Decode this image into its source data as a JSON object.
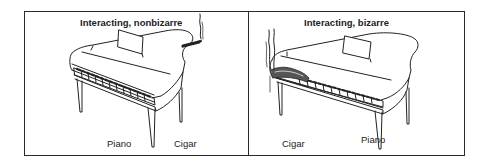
{
  "figure": {
    "panels": [
      {
        "id": "left",
        "title": "Interacting, nonbizarre",
        "labels": {
          "piano": "Piano",
          "cigar": "Cigar"
        },
        "description": "Grand piano with a cigar resting on the lid edge, smoke rising"
      },
      {
        "id": "right",
        "title": "Interacting, bizarre",
        "labels": {
          "cigar": "Cigar",
          "piano": "Piano"
        },
        "description": "Grand piano with a large cigar crushing the keyboard, smoke rising"
      }
    ],
    "colors": {
      "line": "#222222",
      "background": "#ffffff",
      "border": "#2a2a2a"
    }
  }
}
